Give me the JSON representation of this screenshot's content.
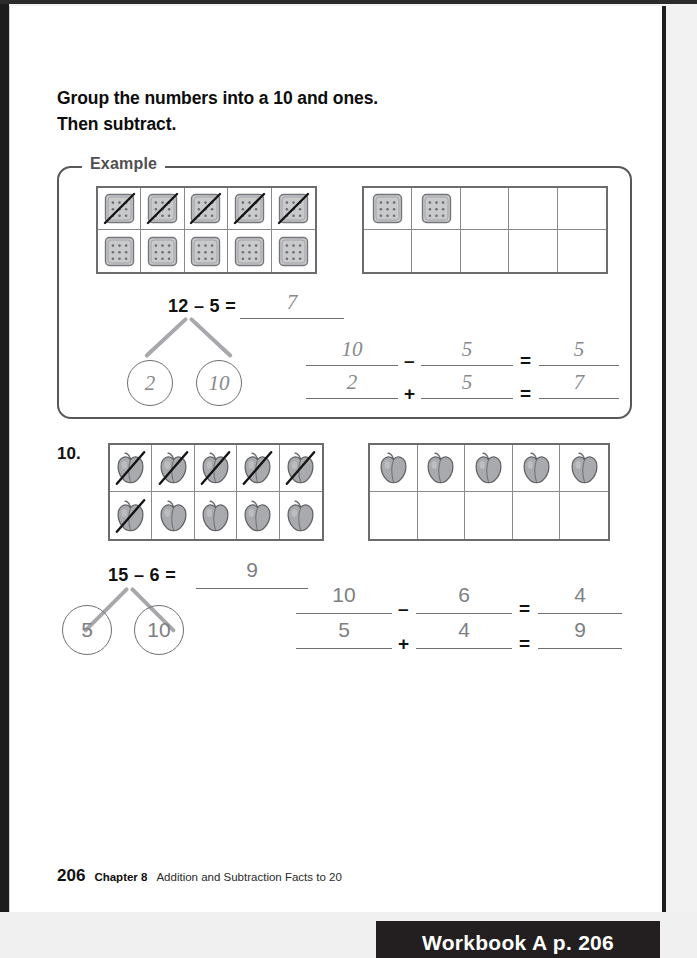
{
  "instructions": {
    "line1": "Group the numbers into a 10 and ones.",
    "line2": "Then subtract."
  },
  "example": {
    "label": "Example",
    "left_frame": {
      "token": "cracker-icon",
      "rows": [
        [
          {
            "filled": true,
            "crossed": true
          },
          {
            "filled": true,
            "crossed": true
          },
          {
            "filled": true,
            "crossed": true
          },
          {
            "filled": true,
            "crossed": true
          },
          {
            "filled": true,
            "crossed": true
          }
        ],
        [
          {
            "filled": true,
            "crossed": false
          },
          {
            "filled": true,
            "crossed": false
          },
          {
            "filled": true,
            "crossed": false
          },
          {
            "filled": true,
            "crossed": false
          },
          {
            "filled": true,
            "crossed": false
          }
        ]
      ]
    },
    "right_frame": {
      "token": "cracker-icon",
      "rows": [
        [
          {
            "filled": true,
            "crossed": false
          },
          {
            "filled": true,
            "crossed": false
          },
          {
            "filled": false,
            "crossed": false
          },
          {
            "filled": false,
            "crossed": false
          },
          {
            "filled": false,
            "crossed": false
          }
        ],
        [
          {
            "filled": false,
            "crossed": false
          },
          {
            "filled": false,
            "crossed": false
          },
          {
            "filled": false,
            "crossed": false
          },
          {
            "filled": false,
            "crossed": false
          },
          {
            "filled": false,
            "crossed": false
          }
        ]
      ]
    },
    "main_equation": {
      "prompt": "12 – 5 =",
      "answer": "7"
    },
    "number_bond": {
      "whole": "12",
      "part_left": "2",
      "part_right": "10"
    },
    "work_line1": {
      "minuend": "10",
      "operator": "–",
      "subtrahend": "5",
      "equals": "=",
      "result": "5"
    },
    "work_line2": {
      "addend1": "2",
      "operator": "+",
      "addend2": "5",
      "equals": "=",
      "result": "7"
    }
  },
  "problem": {
    "number": "10.",
    "left_frame": {
      "token": "apple-icon",
      "rows": [
        [
          {
            "filled": true,
            "crossed": true
          },
          {
            "filled": true,
            "crossed": true
          },
          {
            "filled": true,
            "crossed": true
          },
          {
            "filled": true,
            "crossed": true
          },
          {
            "filled": true,
            "crossed": true
          }
        ],
        [
          {
            "filled": true,
            "crossed": true
          },
          {
            "filled": true,
            "crossed": false
          },
          {
            "filled": true,
            "crossed": false
          },
          {
            "filled": true,
            "crossed": false
          },
          {
            "filled": true,
            "crossed": false
          }
        ]
      ]
    },
    "right_frame": {
      "token": "apple-icon",
      "rows": [
        [
          {
            "filled": true,
            "crossed": false
          },
          {
            "filled": true,
            "crossed": false
          },
          {
            "filled": true,
            "crossed": false
          },
          {
            "filled": true,
            "crossed": false
          },
          {
            "filled": true,
            "crossed": false
          }
        ],
        [
          {
            "filled": false,
            "crossed": false
          },
          {
            "filled": false,
            "crossed": false
          },
          {
            "filled": false,
            "crossed": false
          },
          {
            "filled": false,
            "crossed": false
          },
          {
            "filled": false,
            "crossed": false
          }
        ]
      ]
    },
    "main_equation": {
      "prompt": "15 – 6 =",
      "answer": "9"
    },
    "number_bond": {
      "whole": "15",
      "part_left": "5",
      "part_right": "10"
    },
    "work_line1": {
      "minuend": "10",
      "operator": "–",
      "subtrahend": "6",
      "equals": "=",
      "result": "4"
    },
    "work_line2": {
      "addend1": "5",
      "operator": "+",
      "addend2": "4",
      "equals": "=",
      "result": "9"
    }
  },
  "footer": {
    "page_number": "206",
    "chapter": "Chapter 8",
    "title": "Addition and Subtraction Facts to 20"
  },
  "banner": {
    "text": "Workbook A  p. 206"
  },
  "colors": {
    "ink": "#111111",
    "handwriting": "#86888b",
    "frame_border": "#6c6c6e",
    "banner_bg": "#231f20"
  }
}
